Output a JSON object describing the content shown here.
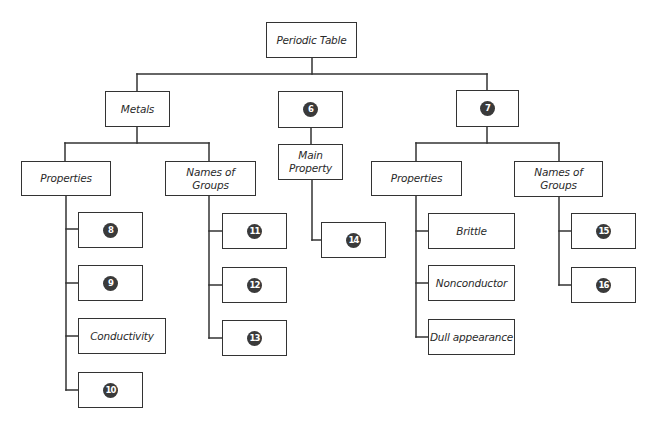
{
  "diagram": {
    "type": "concept-map",
    "line_color": "#333333",
    "badge_color": "#3a3a3a",
    "nodes": [
      {
        "id": "root",
        "label": "Periodic Table",
        "kind": "text",
        "x": 266,
        "y": 22,
        "w": 91,
        "h": 36
      },
      {
        "id": "metals",
        "label": "Metals",
        "kind": "text",
        "x": 105,
        "y": 91,
        "w": 65,
        "h": 36
      },
      {
        "id": "n6",
        "label": "6",
        "kind": "blank",
        "x": 278,
        "y": 91,
        "w": 65,
        "h": 37
      },
      {
        "id": "n7",
        "label": "7",
        "kind": "blank",
        "x": 456,
        "y": 90,
        "w": 63,
        "h": 37
      },
      {
        "id": "metals-properties",
        "label": "Properties",
        "kind": "text",
        "x": 21,
        "y": 161,
        "w": 90,
        "h": 35
      },
      {
        "id": "metals-names-of-groups",
        "label": "Names of\nGroups",
        "kind": "text",
        "x": 165,
        "y": 161,
        "w": 91,
        "h": 35
      },
      {
        "id": "main-property",
        "label": "Main\nProperty",
        "kind": "text",
        "x": 278,
        "y": 144,
        "w": 65,
        "h": 36
      },
      {
        "id": "n7-properties",
        "label": "Properties",
        "kind": "text",
        "x": 371,
        "y": 161,
        "w": 91,
        "h": 35
      },
      {
        "id": "n7-names-of-groups",
        "label": "Names of\nGroups",
        "kind": "text",
        "x": 514,
        "y": 161,
        "w": 89,
        "h": 36
      },
      {
        "id": "n8",
        "label": "8",
        "kind": "blank",
        "x": 78,
        "y": 212,
        "w": 65,
        "h": 36
      },
      {
        "id": "n9",
        "label": "9",
        "kind": "blank",
        "x": 78,
        "y": 265,
        "w": 65,
        "h": 36
      },
      {
        "id": "conductivity",
        "label": "Conductivity",
        "kind": "text",
        "x": 78,
        "y": 318,
        "w": 88,
        "h": 36
      },
      {
        "id": "n10",
        "label": "10",
        "kind": "blank",
        "x": 78,
        "y": 372,
        "w": 65,
        "h": 36
      },
      {
        "id": "n11",
        "label": "11",
        "kind": "blank",
        "x": 222,
        "y": 213,
        "w": 65,
        "h": 36
      },
      {
        "id": "n12",
        "label": "12",
        "kind": "blank",
        "x": 222,
        "y": 267,
        "w": 65,
        "h": 36
      },
      {
        "id": "n13",
        "label": "13",
        "kind": "blank",
        "x": 222,
        "y": 320,
        "w": 65,
        "h": 36
      },
      {
        "id": "n14",
        "label": "14",
        "kind": "blank",
        "x": 321,
        "y": 222,
        "w": 65,
        "h": 36
      },
      {
        "id": "brittle",
        "label": "Brittle",
        "kind": "text",
        "x": 428,
        "y": 213,
        "w": 87,
        "h": 36
      },
      {
        "id": "nonconductor",
        "label": "Nonconductor",
        "kind": "text",
        "x": 428,
        "y": 265,
        "w": 87,
        "h": 36
      },
      {
        "id": "dull-appearance",
        "label": "Dull appearance",
        "kind": "text",
        "x": 428,
        "y": 319,
        "w": 87,
        "h": 36
      },
      {
        "id": "n15",
        "label": "15",
        "kind": "blank",
        "x": 571,
        "y": 213,
        "w": 65,
        "h": 36
      },
      {
        "id": "n16",
        "label": "16",
        "kind": "blank",
        "x": 571,
        "y": 267,
        "w": 65,
        "h": 36
      }
    ],
    "edges": [
      [
        "root",
        "metals"
      ],
      [
        "root",
        "n6"
      ],
      [
        "root",
        "n7"
      ],
      [
        "metals",
        "metals-properties"
      ],
      [
        "metals",
        "metals-names-of-groups"
      ],
      [
        "n6",
        "main-property"
      ],
      [
        "main-property",
        "n14"
      ],
      [
        "n7",
        "n7-properties"
      ],
      [
        "n7",
        "n7-names-of-groups"
      ],
      [
        "metals-properties",
        "n8"
      ],
      [
        "metals-properties",
        "n9"
      ],
      [
        "metals-properties",
        "conductivity"
      ],
      [
        "metals-properties",
        "n10"
      ],
      [
        "metals-names-of-groups",
        "n11"
      ],
      [
        "metals-names-of-groups",
        "n12"
      ],
      [
        "metals-names-of-groups",
        "n13"
      ],
      [
        "n7-properties",
        "brittle"
      ],
      [
        "n7-properties",
        "nonconductor"
      ],
      [
        "n7-properties",
        "dull-appearance"
      ],
      [
        "n7-names-of-groups",
        "n15"
      ],
      [
        "n7-names-of-groups",
        "n16"
      ]
    ],
    "segments": [
      [
        312,
        58,
        312,
        74
      ],
      [
        137,
        74,
        487,
        74
      ],
      [
        137,
        74,
        137,
        91
      ],
      [
        487,
        74,
        487,
        90
      ],
      [
        137,
        127,
        137,
        143
      ],
      [
        65,
        143,
        209,
        143
      ],
      [
        65,
        143,
        65,
        161
      ],
      [
        209,
        143,
        209,
        161
      ],
      [
        311,
        128,
        311,
        144
      ],
      [
        487,
        127,
        487,
        143
      ],
      [
        416,
        143,
        559,
        143
      ],
      [
        416,
        143,
        416,
        161
      ],
      [
        559,
        143,
        559,
        161
      ],
      [
        66,
        196,
        66,
        390
      ],
      [
        66,
        229,
        78,
        229
      ],
      [
        66,
        283,
        78,
        283
      ],
      [
        66,
        336,
        78,
        336
      ],
      [
        66,
        390,
        78,
        390
      ],
      [
        209,
        196,
        209,
        338
      ],
      [
        209,
        231,
        222,
        231
      ],
      [
        209,
        285,
        222,
        285
      ],
      [
        209,
        338,
        222,
        338
      ],
      [
        312,
        180,
        312,
        240
      ],
      [
        312,
        240,
        321,
        240
      ],
      [
        416,
        196,
        416,
        337
      ],
      [
        416,
        231,
        428,
        231
      ],
      [
        416,
        283,
        428,
        283
      ],
      [
        416,
        337,
        428,
        337
      ],
      [
        559,
        197,
        559,
        285
      ],
      [
        559,
        231,
        571,
        231
      ],
      [
        559,
        285,
        571,
        285
      ]
    ]
  }
}
